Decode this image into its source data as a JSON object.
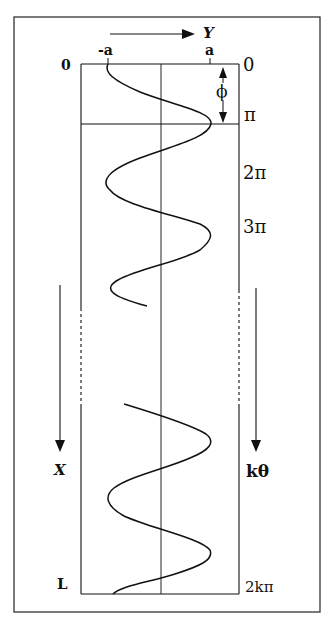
{
  "diagram": {
    "axis_top": {
      "label": "Y",
      "arrow": "right-arrow-icon"
    },
    "tick_labels_top": {
      "neg_a": "-a",
      "pos_a": "a"
    },
    "left_axis": {
      "top": "0",
      "arrow_label": "X",
      "bottom": "L"
    },
    "right_axis": {
      "labels": [
        "0",
        "π",
        "2π",
        "3π"
      ],
      "arrow_label": "kθ",
      "bottom": "2kπ"
    },
    "phase_label": "ϕ",
    "colors": {
      "line": "#111111",
      "frame": "#333333",
      "background": "#ffffff"
    }
  }
}
